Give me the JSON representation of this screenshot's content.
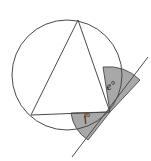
{
  "figure": {
    "name": "circle-tangent-inscribed-triangle",
    "background_color": "#ffffff",
    "stroke_color": "#4a4a4a",
    "shade_fill_color": "#a8a8a8",
    "shade_stroke_color": "#555555",
    "label_color": "#111111"
  },
  "circle": {
    "center_x": 67,
    "center_y": 75,
    "radius": 55,
    "stroke_width": 1
  },
  "triangle": {
    "vertices": [
      {
        "name": "apex-top",
        "x": 78,
        "y": 20
      },
      {
        "name": "vertex-left",
        "x": 31,
        "y": 115
      },
      {
        "name": "vertex-tangent-point",
        "x": 110,
        "y": 112
      }
    ]
  },
  "tangent_line": {
    "name": "tangent-line",
    "x1": 72,
    "y1": 157,
    "x2": 148,
    "y2": 57,
    "touch_x": 110,
    "touch_y": 112
  },
  "angles": [
    {
      "id": "angle-e",
      "label": "e°",
      "label_x": 112,
      "label_y": 89,
      "vertex_x": 110,
      "vertex_y": 112,
      "sector_path": "M 110 112 L 103 67 A 46 46 0 0 1 140 80 Z"
    },
    {
      "id": "angle-f",
      "label": "f°",
      "label_x": 88,
      "label_y": 121,
      "vertex_x": 110,
      "vertex_y": 112,
      "sector_path": "M 110 112 L 71 113 A 39 39 0 0 0 88 140 Z"
    }
  ]
}
